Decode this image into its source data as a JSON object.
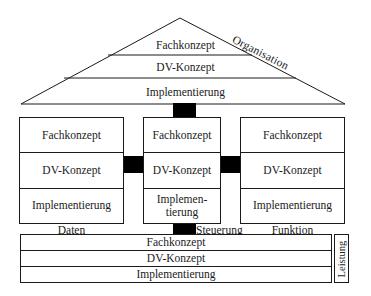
{
  "diagram": {
    "roof": {
      "label_right": "Organisation",
      "levels": [
        "Fachkonzept",
        "DV-Konzept",
        "Implementierung"
      ]
    },
    "columns": [
      {
        "axis_label": "Daten",
        "levels": [
          "Fachkonzept",
          "DV-Konzept",
          "Implementierung"
        ]
      },
      {
        "axis_label": "Steuerung",
        "levels": [
          "Fachkonzept",
          "DV-Konzept",
          "Implemen-\ntierung"
        ]
      },
      {
        "axis_label": "Funktion",
        "levels": [
          "Fachkonzept",
          "DV-Konzept",
          "Implementierung"
        ]
      }
    ],
    "base": {
      "side_label": "Leistung",
      "levels": [
        "Fachkonzept",
        "DV-Konzept",
        "Implementierung"
      ]
    },
    "colors": {
      "line": "#1a1a1a",
      "connector": "#000000",
      "background": "#ffffff"
    }
  }
}
